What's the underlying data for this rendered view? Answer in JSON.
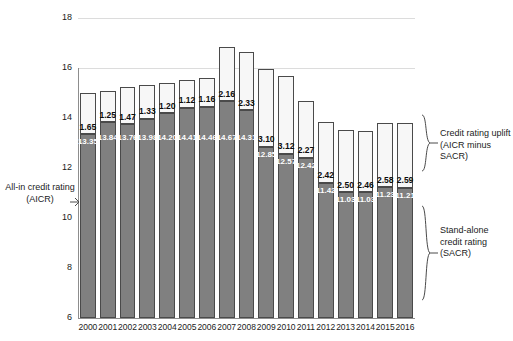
{
  "chart_data": {
    "type": "bar",
    "stacked": true,
    "title": "",
    "xlabel": "",
    "ylabel": "",
    "ylim": [
      6,
      18
    ],
    "yticks": [
      6,
      8,
      10,
      12,
      14,
      16,
      18
    ],
    "gridlines": [
      16,
      18
    ],
    "grid": true,
    "legend_position": "none",
    "categories": [
      "2000",
      "2001",
      "2002",
      "2003",
      "2004",
      "2005",
      "2006",
      "2007",
      "2008",
      "2009",
      "2010",
      "2011",
      "2012",
      "2013",
      "2014",
      "2015",
      "2016"
    ],
    "series": [
      {
        "name": "Stand-alone credit rating (SACR)",
        "color": "#808080",
        "values": [
          13.35,
          13.84,
          13.76,
          13.98,
          14.2,
          14.41,
          14.46,
          14.67,
          14.31,
          12.85,
          12.57,
          12.42,
          11.42,
          11.03,
          11.03,
          11.23,
          11.21
        ]
      },
      {
        "name": "Credit rating uplift (AICR minus SACR)",
        "color": "#f7f7f7",
        "values": [
          1.65,
          1.25,
          1.47,
          1.33,
          1.2,
          1.12,
          1.16,
          2.16,
          2.33,
          3.1,
          3.12,
          2.27,
          2.42,
          2.5,
          2.46,
          2.58,
          2.59
        ]
      }
    ],
    "totals_label": "All-in credit rating (AICR)"
  },
  "annotations": {
    "left_label": "All-in credit rating (AICR)",
    "right_top_label": "Credit rating uplift (AICR minus SACR)",
    "right_bottom_label": "Stand-alone credit rating (SACR)"
  }
}
